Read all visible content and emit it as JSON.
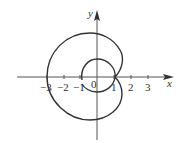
{
  "figure": {
    "type": "polar-curve-plot",
    "axes": {
      "x_label": "x",
      "y_label": "y",
      "x_ticks": [
        "−3",
        "−2",
        "−1",
        "0",
        "1",
        "2",
        "3"
      ],
      "origin_label": "0"
    },
    "colors": {
      "curve": "#333333",
      "axis": "#555555",
      "background": "#ffffff"
    }
  }
}
